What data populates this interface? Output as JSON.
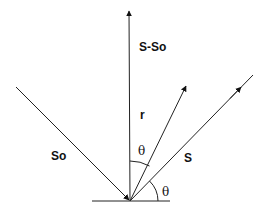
{
  "diagram": {
    "labels": {
      "s_minus_so": "S-So",
      "r": "r",
      "so": "So",
      "s": "S",
      "theta_upper": "θ",
      "theta_lower": "θ"
    },
    "colors": {
      "stroke": "#222222",
      "background": "#ffffff"
    },
    "vectors": [
      {
        "name": "S-So",
        "from": [
          130,
          201
        ],
        "to": [
          129,
          10
        ],
        "arrow": "end"
      },
      {
        "name": "r",
        "from": [
          130,
          201
        ],
        "to": [
          186,
          85
        ],
        "arrow": "end"
      },
      {
        "name": "S",
        "from": [
          130,
          201
        ],
        "to": [
          253,
          75
        ],
        "arrow": "mid"
      },
      {
        "name": "So",
        "from": [
          16,
          87
        ],
        "to": [
          130,
          201
        ],
        "arrow": "end"
      }
    ],
    "surface": {
      "from": [
        92,
        201
      ],
      "to": [
        170,
        201
      ]
    }
  }
}
